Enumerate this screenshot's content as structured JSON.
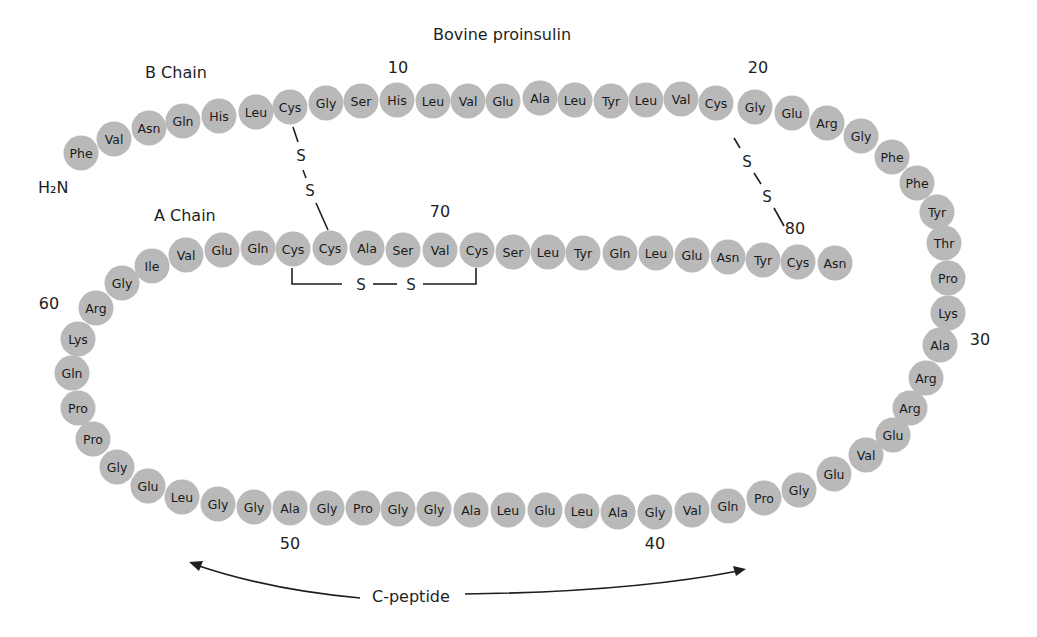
{
  "figure": {
    "title": "Bovine proinsulin",
    "b_chain_label": "B Chain",
    "a_chain_label": "A Chain",
    "n_terminus_label": "H₂N",
    "c_peptide_label": "C-peptide",
    "residue_fill": "#b9b9b9",
    "text_color": "#1e1e1e"
  },
  "position_markers": [
    {
      "label": "10",
      "x": 398,
      "y": 73
    },
    {
      "label": "20",
      "x": 758,
      "y": 73
    },
    {
      "label": "30",
      "x": 980,
      "y": 345
    },
    {
      "label": "40",
      "x": 655,
      "y": 549
    },
    {
      "label": "50",
      "x": 290,
      "y": 549
    },
    {
      "label": "60",
      "x": 49,
      "y": 309
    },
    {
      "label": "70",
      "x": 440,
      "y": 217
    },
    {
      "label": "80",
      "x": 795,
      "y": 234
    }
  ],
  "disulfide_bonds": [
    {
      "from": 7,
      "to": 67,
      "atoms": [
        "S",
        "S"
      ]
    },
    {
      "from": 19,
      "to": 80,
      "atoms": [
        "S",
        "S"
      ]
    },
    {
      "from": 66,
      "to": 71,
      "atoms": [
        "S",
        "S"
      ]
    }
  ],
  "residues": [
    {
      "n": 1,
      "aa": "Phe",
      "x": 81,
      "y": 153
    },
    {
      "n": 2,
      "aa": "Val",
      "x": 114,
      "y": 139
    },
    {
      "n": 3,
      "aa": "Asn",
      "x": 149,
      "y": 128
    },
    {
      "n": 4,
      "aa": "Gln",
      "x": 183,
      "y": 121
    },
    {
      "n": 5,
      "aa": "His",
      "x": 219,
      "y": 116
    },
    {
      "n": 6,
      "aa": "Leu",
      "x": 256,
      "y": 112
    },
    {
      "n": 7,
      "aa": "Cys",
      "x": 290,
      "y": 107
    },
    {
      "n": 8,
      "aa": "Gly",
      "x": 326,
      "y": 103
    },
    {
      "n": 9,
      "aa": "Ser",
      "x": 361,
      "y": 101
    },
    {
      "n": 10,
      "aa": "His",
      "x": 397,
      "y": 100
    },
    {
      "n": 11,
      "aa": "Leu",
      "x": 433,
      "y": 101
    },
    {
      "n": 12,
      "aa": "Val",
      "x": 468,
      "y": 101
    },
    {
      "n": 13,
      "aa": "Glu",
      "x": 503,
      "y": 101
    },
    {
      "n": 14,
      "aa": "Ala",
      "x": 540,
      "y": 98
    },
    {
      "n": 15,
      "aa": "Leu",
      "x": 575,
      "y": 100
    },
    {
      "n": 16,
      "aa": "Tyr",
      "x": 611,
      "y": 101
    },
    {
      "n": 17,
      "aa": "Leu",
      "x": 646,
      "y": 100
    },
    {
      "n": 18,
      "aa": "Val",
      "x": 681,
      "y": 99
    },
    {
      "n": 19,
      "aa": "Cys",
      "x": 716,
      "y": 103
    },
    {
      "n": 20,
      "aa": "Gly",
      "x": 755,
      "y": 107
    },
    {
      "n": 21,
      "aa": "Glu",
      "x": 792,
      "y": 113
    },
    {
      "n": 22,
      "aa": "Arg",
      "x": 827,
      "y": 123
    },
    {
      "n": 23,
      "aa": "Gly",
      "x": 861,
      "y": 136
    },
    {
      "n": 24,
      "aa": "Phe",
      "x": 892,
      "y": 157
    },
    {
      "n": 25,
      "aa": "Phe",
      "x": 917,
      "y": 183
    },
    {
      "n": 26,
      "aa": "Tyr",
      "x": 937,
      "y": 212
    },
    {
      "n": 27,
      "aa": "Thr",
      "x": 944,
      "y": 243
    },
    {
      "n": 28,
      "aa": "Pro",
      "x": 948,
      "y": 278
    },
    {
      "n": 29,
      "aa": "Lys",
      "x": 948,
      "y": 313
    },
    {
      "n": 30,
      "aa": "Ala",
      "x": 940,
      "y": 345
    },
    {
      "n": 31,
      "aa": "Arg",
      "x": 926,
      "y": 378
    },
    {
      "n": 32,
      "aa": "Arg",
      "x": 910,
      "y": 408
    },
    {
      "n": 33,
      "aa": "Glu",
      "x": 893,
      "y": 435
    },
    {
      "n": 34,
      "aa": "Val",
      "x": 866,
      "y": 455
    },
    {
      "n": 35,
      "aa": "Glu",
      "x": 834,
      "y": 474
    },
    {
      "n": 36,
      "aa": "Gly",
      "x": 799,
      "y": 490
    },
    {
      "n": 37,
      "aa": "Pro",
      "x": 764,
      "y": 498
    },
    {
      "n": 38,
      "aa": "Gln",
      "x": 728,
      "y": 506
    },
    {
      "n": 39,
      "aa": "Val",
      "x": 692,
      "y": 510
    },
    {
      "n": 40,
      "aa": "Gly",
      "x": 655,
      "y": 512
    },
    {
      "n": 41,
      "aa": "Ala",
      "x": 618,
      "y": 512
    },
    {
      "n": 42,
      "aa": "Leu",
      "x": 582,
      "y": 511
    },
    {
      "n": 43,
      "aa": "Glu",
      "x": 545,
      "y": 510
    },
    {
      "n": 44,
      "aa": "Leu",
      "x": 508,
      "y": 510
    },
    {
      "n": 45,
      "aa": "Ala",
      "x": 471,
      "y": 510
    },
    {
      "n": 46,
      "aa": "Gly",
      "x": 434,
      "y": 509
    },
    {
      "n": 47,
      "aa": "Gly",
      "x": 398,
      "y": 509
    },
    {
      "n": 48,
      "aa": "Pro",
      "x": 363,
      "y": 508
    },
    {
      "n": 49,
      "aa": "Gly",
      "x": 327,
      "y": 508
    },
    {
      "n": 50,
      "aa": "Ala",
      "x": 290,
      "y": 508
    },
    {
      "n": 51,
      "aa": "Gly",
      "x": 254,
      "y": 507
    },
    {
      "n": 52,
      "aa": "Gly",
      "x": 218,
      "y": 504
    },
    {
      "n": 53,
      "aa": "Leu",
      "x": 182,
      "y": 497
    },
    {
      "n": 54,
      "aa": "Glu",
      "x": 148,
      "y": 486
    },
    {
      "n": 55,
      "aa": "Gly",
      "x": 117,
      "y": 467
    },
    {
      "n": 56,
      "aa": "Pro",
      "x": 93,
      "y": 439
    },
    {
      "n": 57,
      "aa": "Pro",
      "x": 78,
      "y": 408
    },
    {
      "n": 58,
      "aa": "Gln",
      "x": 72,
      "y": 373
    },
    {
      "n": 59,
      "aa": "Lys",
      "x": 78,
      "y": 339
    },
    {
      "n": 60,
      "aa": "Arg",
      "x": 96,
      "y": 308
    },
    {
      "n": 61,
      "aa": "Gly",
      "x": 122,
      "y": 283
    },
    {
      "n": 62,
      "aa": "Ile",
      "x": 152,
      "y": 266
    },
    {
      "n": 63,
      "aa": "Val",
      "x": 186,
      "y": 255
    },
    {
      "n": 64,
      "aa": "Glu",
      "x": 222,
      "y": 250
    },
    {
      "n": 65,
      "aa": "Gln",
      "x": 258,
      "y": 248
    },
    {
      "n": 66,
      "aa": "Cys",
      "x": 293,
      "y": 249
    },
    {
      "n": 67,
      "aa": "Cys",
      "x": 330,
      "y": 248
    },
    {
      "n": 68,
      "aa": "Ala",
      "x": 367,
      "y": 248
    },
    {
      "n": 69,
      "aa": "Ser",
      "x": 403,
      "y": 250
    },
    {
      "n": 70,
      "aa": "Val",
      "x": 440,
      "y": 250
    },
    {
      "n": 71,
      "aa": "Cys",
      "x": 477,
      "y": 250
    },
    {
      "n": 72,
      "aa": "Ser",
      "x": 513,
      "y": 252
    },
    {
      "n": 73,
      "aa": "Leu",
      "x": 548,
      "y": 252
    },
    {
      "n": 74,
      "aa": "Tyr",
      "x": 583,
      "y": 253
    },
    {
      "n": 75,
      "aa": "Gln",
      "x": 620,
      "y": 253
    },
    {
      "n": 76,
      "aa": "Leu",
      "x": 656,
      "y": 253
    },
    {
      "n": 77,
      "aa": "Glu",
      "x": 692,
      "y": 255
    },
    {
      "n": 78,
      "aa": "Asn",
      "x": 728,
      "y": 257
    },
    {
      "n": 79,
      "aa": "Tyr",
      "x": 763,
      "y": 260
    },
    {
      "n": 80,
      "aa": "Cys",
      "x": 798,
      "y": 262
    },
    {
      "n": 81,
      "aa": "Asn",
      "x": 835,
      "y": 263
    }
  ]
}
